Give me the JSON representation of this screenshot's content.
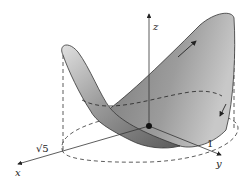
{
  "figure": {
    "type": "3d-surface-diagram",
    "axes": {
      "x_label": "x",
      "y_label": "y",
      "z_label": "z"
    },
    "annotations": {
      "sqrt5_label": "√5",
      "one_label": "1"
    },
    "colors": {
      "surface_light": "#d9d9d9",
      "surface_dark": "#6e6e6e",
      "line": "#222222"
    }
  }
}
